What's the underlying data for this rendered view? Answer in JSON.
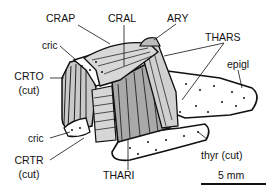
{
  "labels": {
    "crap": "CRAP",
    "cral": "CRAL",
    "ary": "ARY",
    "thars": "THARS",
    "epigl": "epigl",
    "cric_top": "cric",
    "crto_1": "CRTO",
    "crto_2": "(cut)",
    "cric_bottom": "cric",
    "crtr_1": "CRTR",
    "crtr_2": "(cut)",
    "thari": "THARI",
    "thyr": "thyr (cut)"
  },
  "scale_bar": {
    "label": "5 mm"
  },
  "colors": {
    "line": "#111111",
    "muscle_light": "#cfcfcf",
    "muscle_mid": "#a8a8a8",
    "cartilage": "#ffffff"
  }
}
